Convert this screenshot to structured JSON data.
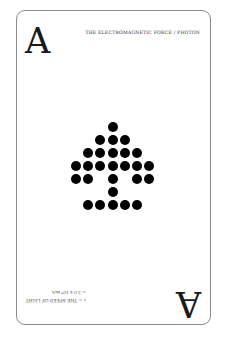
{
  "card": {
    "rank": "A",
    "title": "THE ELECTROMAGNETIC FORCE / PHOTON",
    "footer_line1": "c = THE SPEED OF LIGHT",
    "footer_line2": "= 3.0 x 10⁸ m/s",
    "pip_grid": [
      [
        0,
        0,
        0,
        1,
        0,
        0,
        0
      ],
      [
        0,
        0,
        1,
        1,
        1,
        0,
        0
      ],
      [
        0,
        1,
        1,
        1,
        1,
        1,
        0
      ],
      [
        1,
        1,
        1,
        1,
        1,
        1,
        1
      ],
      [
        1,
        1,
        0,
        1,
        0,
        1,
        1
      ],
      [
        0,
        0,
        0,
        1,
        0,
        0,
        0
      ],
      [
        0,
        1,
        1,
        1,
        1,
        1,
        0
      ]
    ],
    "pip_color": "#000000"
  }
}
